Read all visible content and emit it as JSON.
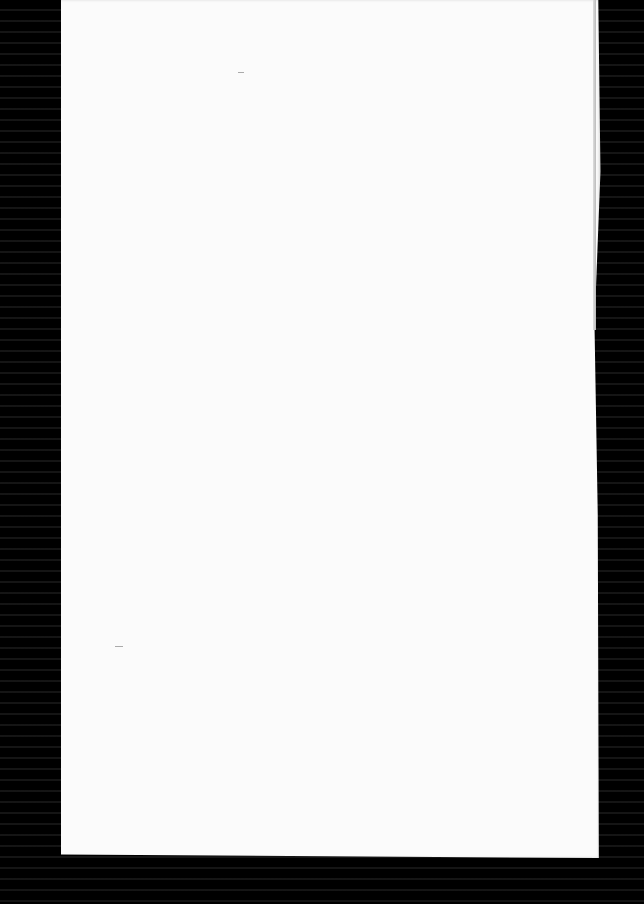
{
  "scene": {
    "description": "Blank white sheet of paper on a black background",
    "background_color": "#000000",
    "paper_color": "#fbfbfb"
  }
}
